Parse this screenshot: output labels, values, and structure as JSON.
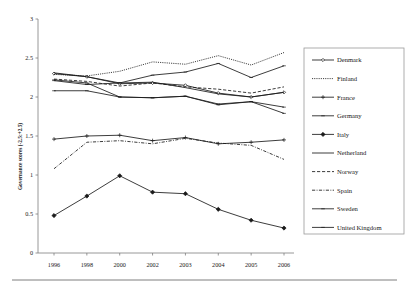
{
  "chart_data": {
    "type": "line",
    "title": "",
    "xlabel": "",
    "ylabel": "Governance scores (-2.5:+2.5)",
    "categories": [
      "1996",
      "1998",
      "2000",
      "2002",
      "2003",
      "2004",
      "2005",
      "2006"
    ],
    "ylim": [
      0,
      3
    ],
    "yticks": [
      "0",
      "0.5",
      "1",
      "1.5",
      "2",
      "2.5",
      "3"
    ],
    "ytick_values": [
      0,
      0.5,
      1,
      1.5,
      2,
      2.5,
      3
    ],
    "grid": false,
    "legend_position": "right",
    "series": [
      {
        "name": "Denmark",
        "style": "solid-marker",
        "marker": "diamond-small",
        "values": [
          2.3,
          2.26,
          2.17,
          2.18,
          2.15,
          2.05,
          2.0,
          2.06
        ]
      },
      {
        "name": "Finland",
        "style": "dotted",
        "marker": "none",
        "values": [
          2.29,
          2.27,
          2.33,
          2.45,
          2.42,
          2.53,
          2.41,
          2.57
        ]
      },
      {
        "name": "France",
        "style": "solid-plus",
        "marker": "plus",
        "values": [
          1.46,
          1.5,
          1.51,
          1.44,
          1.48,
          1.4,
          1.42,
          1.45
        ]
      },
      {
        "name": "Germany",
        "style": "solid-marker",
        "marker": "dash",
        "values": [
          2.22,
          2.18,
          2.0,
          1.99,
          2.01,
          1.9,
          1.94,
          1.87
        ]
      },
      {
        "name": "Italy",
        "style": "solid-filled",
        "marker": "diamond-filled",
        "values": [
          0.48,
          0.73,
          0.99,
          0.78,
          0.76,
          0.56,
          0.42,
          0.32
        ]
      },
      {
        "name": "Netherland",
        "style": "solid-plain",
        "marker": "none",
        "values": [
          2.31,
          2.26,
          2.18,
          2.19,
          2.12,
          2.04,
          2.0,
          2.06
        ]
      },
      {
        "name": "Norway",
        "style": "dashed",
        "marker": "none",
        "values": [
          2.23,
          2.2,
          2.14,
          2.18,
          2.13,
          2.1,
          2.05,
          2.13
        ]
      },
      {
        "name": "Spain",
        "style": "dash-dot",
        "marker": "none",
        "values": [
          1.08,
          1.42,
          1.44,
          1.4,
          1.47,
          1.41,
          1.38,
          1.2
        ]
      },
      {
        "name": "Sweden",
        "style": "solid-marker",
        "marker": "dash",
        "values": [
          2.21,
          2.16,
          2.18,
          2.28,
          2.32,
          2.43,
          2.25,
          2.4
        ]
      },
      {
        "name": "United Kingdom",
        "style": "solid-marker",
        "marker": "dash",
        "values": [
          2.08,
          2.08,
          2.0,
          1.99,
          2.01,
          1.91,
          1.94,
          1.79
        ]
      }
    ]
  },
  "legend": {
    "items": [
      {
        "label": "Denmark"
      },
      {
        "label": "Finland"
      },
      {
        "label": "France"
      },
      {
        "label": "Germany"
      },
      {
        "label": "Italy"
      },
      {
        "label": "Netherland"
      },
      {
        "label": "Norway"
      },
      {
        "label": "Spain"
      },
      {
        "label": "Sweden"
      },
      {
        "label": "United Kingdom"
      }
    ]
  },
  "colors": {
    "ink": "#1a1a1a",
    "axis": "#7d7d7d",
    "legend_border": "#9a9a9a",
    "background": "#ffffff"
  }
}
